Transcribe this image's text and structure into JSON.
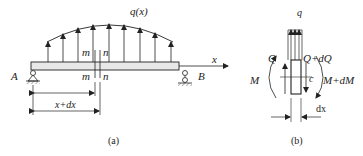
{
  "figure_a": {
    "load_label": "q(x)",
    "section_top_m": "m",
    "section_top_n": "n",
    "section_bottom_m": "m",
    "section_bottom_n": "n",
    "support_left": "A",
    "support_right": "B",
    "axis_label": "x",
    "dim_label": "x+dx",
    "caption": "(a)"
  },
  "figure_b": {
    "load_label": "q",
    "shear_left": "Q",
    "shear_right": "Q+dQ",
    "moment_left": "M",
    "moment_right": "M+dM",
    "point_label": "c",
    "width_label": "dx",
    "caption": "(b)"
  },
  "colors": {
    "line": "#222222",
    "beam_fill": "#e8e8e8"
  }
}
